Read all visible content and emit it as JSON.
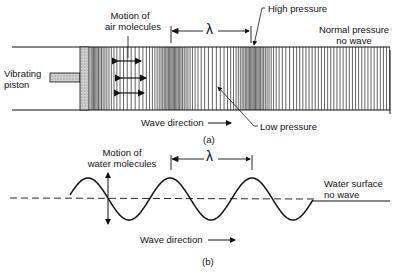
{
  "panel_a": {
    "caption": "(a)",
    "motion_label_line1": "Motion of",
    "motion_label_line2": "air molecules",
    "lambda": "λ",
    "high_pressure": "High pressure",
    "low_pressure": "Low pressure",
    "normal_line1": "Normal pressure",
    "normal_line2": "no wave",
    "piston_line1": "Vibrating",
    "piston_line2": "piston",
    "wave_direction": "Wave direction"
  },
  "panel_b": {
    "caption": "(b)",
    "motion_label_line1": "Motion of",
    "motion_label_line2": "water molecules",
    "lambda": "λ",
    "surface_line1": "Water surface",
    "surface_line2": "no wave",
    "wave_direction": "Wave direction"
  }
}
